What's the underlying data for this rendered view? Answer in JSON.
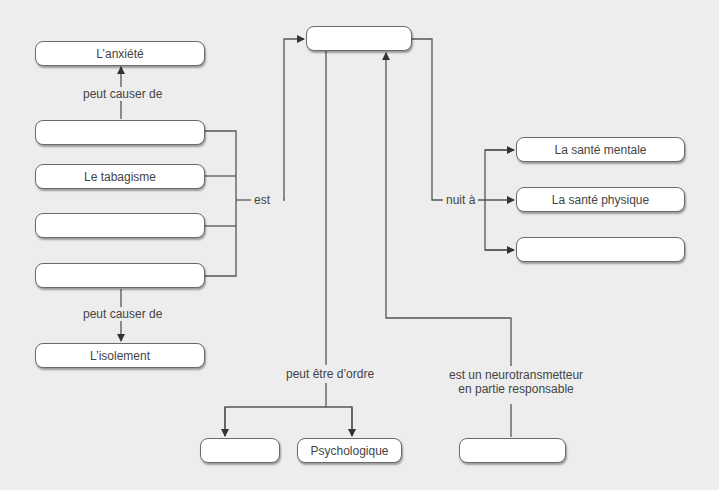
{
  "diagram": {
    "type": "concept-map",
    "nodes": {
      "anxiety": "L’anxiété",
      "blank_left_1": "",
      "smoking": "Le tabagisme",
      "blank_left_2": "",
      "blank_left_3": "",
      "isolation": "L’isolement",
      "center_top": "",
      "mental_health": "La santé mentale",
      "physical_health": "La santé physique",
      "blank_right": "",
      "blank_bottom_left": "",
      "psychological": "Psychologique",
      "blank_bottom_right": ""
    },
    "links": {
      "causes_anxiety": "peut causer de",
      "causes_isolation": "peut causer de",
      "is": "est",
      "harms": "nuit à",
      "can_be_of_type": "peut être d’ordre",
      "neurotransmitter_line1": "est un neurotransmetteur",
      "neurotransmitter_line2": "en partie responsable"
    },
    "colors": {
      "background": "#ededed",
      "box_fill": "#ffffff",
      "line": "#555555"
    }
  }
}
